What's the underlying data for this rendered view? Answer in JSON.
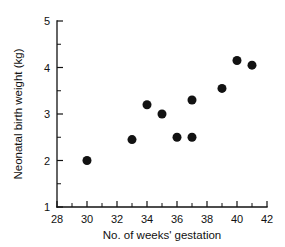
{
  "chart_data": {
    "type": "scatter",
    "title": "",
    "xlabel": "No. of weeks' gestation",
    "ylabel": "Neonatal birth weight (kg)",
    "xlim": [
      28,
      42
    ],
    "ylim": [
      1,
      5
    ],
    "xticks": [
      28,
      30,
      32,
      34,
      36,
      38,
      40,
      42
    ],
    "xtick_labels": [
      "28",
      "30",
      "32",
      "34",
      "36",
      "38",
      "40",
      "42"
    ],
    "xminor_ticks": [
      29,
      31,
      33,
      35,
      37,
      39,
      41
    ],
    "yticks": [
      1,
      2,
      3,
      4,
      5
    ],
    "ytick_labels": [
      "1",
      "2",
      "3",
      "4",
      "5"
    ],
    "yminor_ticks": [
      1.5,
      2.5,
      3.5,
      4.5
    ],
    "grid": false,
    "legend": false,
    "marker": "filled-circle",
    "marker_color": "#121212",
    "marker_size_px": 9,
    "x": [
      30,
      33,
      34,
      35,
      36,
      37,
      37,
      39,
      40,
      41
    ],
    "y": [
      2.0,
      2.45,
      3.2,
      3.0,
      2.5,
      2.5,
      3.3,
      3.55,
      4.15,
      4.05
    ],
    "points": [
      {
        "x": 30,
        "y": 2.0
      },
      {
        "x": 33,
        "y": 2.45
      },
      {
        "x": 34,
        "y": 3.2
      },
      {
        "x": 35,
        "y": 3.0
      },
      {
        "x": 36,
        "y": 2.5
      },
      {
        "x": 37,
        "y": 2.5
      },
      {
        "x": 37,
        "y": 3.3
      },
      {
        "x": 39,
        "y": 3.55
      },
      {
        "x": 40,
        "y": 4.15
      },
      {
        "x": 41,
        "y": 4.05
      }
    ]
  },
  "axes": {
    "x_title": "No. of weeks' gestation",
    "y_title": "Neonatal birth weight (kg)",
    "x_labels": [
      "28",
      "30",
      "32",
      "34",
      "36",
      "38",
      "40",
      "42"
    ],
    "y_labels": [
      "1",
      "2",
      "3",
      "4",
      "5"
    ]
  },
  "colors": {
    "ink": "#111111",
    "marker": "#121212",
    "background": "#ffffff"
  }
}
